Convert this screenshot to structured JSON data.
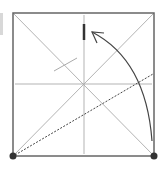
{
  "diagram": {
    "type": "origami-fold-step",
    "colors": {
      "paper_edge": "#666666",
      "crease": "#aaaaaa",
      "arrow": "#444444",
      "marker": "#333333",
      "dot": "#333333"
    },
    "square": {
      "x1": 13,
      "y1": 13,
      "x2": 154,
      "y2": 156
    },
    "creases": [
      {
        "name": "diagonal-tl-br",
        "x1": 13,
        "y1": 13,
        "x2": 154,
        "y2": 156
      },
      {
        "name": "diagonal-bl-tr",
        "x1": 13,
        "y1": 156,
        "x2": 154,
        "y2": 13
      },
      {
        "name": "vertical-center",
        "x1": 84,
        "y1": 15,
        "x2": 84,
        "y2": 154
      },
      {
        "name": "horizontal-center",
        "x1": 15,
        "y1": 84,
        "x2": 152,
        "y2": 84
      }
    ],
    "valley_fold_line": {
      "x1": 15,
      "y1": 155,
      "x2": 153,
      "y2": 74
    },
    "reference_mark": {
      "x1": 54,
      "y1": 71,
      "x2": 77,
      "y2": 58
    },
    "target_mark": {
      "x1": 84,
      "y1": 24,
      "x2": 84,
      "y2": 40
    },
    "fold_arrow": {
      "start": [
        152,
        141
      ],
      "control": [
        146,
        60
      ],
      "end": [
        92,
        32
      ]
    },
    "corner_dots": [
      {
        "name": "bottom-left",
        "cx": 13,
        "cy": 156
      },
      {
        "name": "bottom-right",
        "cx": 154,
        "cy": 156
      }
    ]
  }
}
